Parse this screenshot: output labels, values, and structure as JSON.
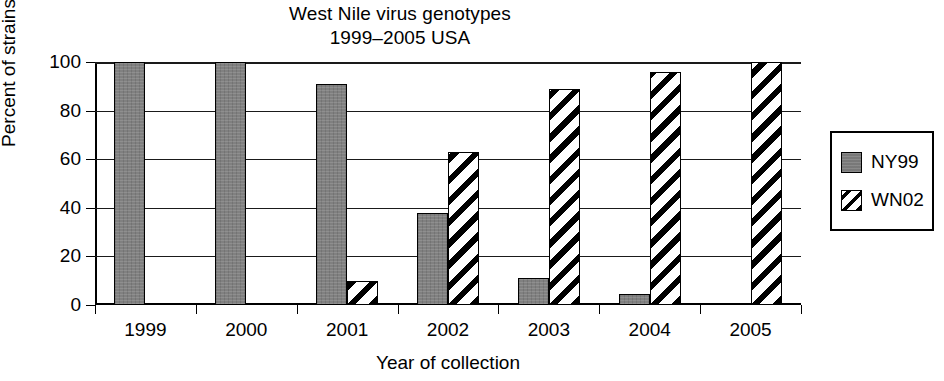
{
  "chart_data": {
    "type": "bar",
    "title": "West Nile virus genotypes",
    "subtitle": "1999–2005 USA",
    "xlabel": "Year of collection",
    "ylabel": "Percent of strains",
    "categories": [
      "1999",
      "2000",
      "2001",
      "2002",
      "2003",
      "2004",
      "2005"
    ],
    "series": [
      {
        "name": "NY99",
        "color": "#808080",
        "fill": "solid-gray",
        "values": [
          100,
          100,
          91,
          38,
          11,
          4.5,
          0
        ]
      },
      {
        "name": "WN02",
        "color": "#000000",
        "fill": "diagonal-hatch",
        "values": [
          0,
          0,
          10,
          63,
          89,
          96,
          100
        ]
      }
    ],
    "ylim": [
      0,
      100
    ],
    "yticks": [
      0,
      20,
      40,
      60,
      80,
      100
    ],
    "ytick_labels": [
      "0",
      "20",
      "40",
      "60",
      "80",
      "100"
    ],
    "grid": true,
    "grid_axis": "y",
    "legend_position": "right-outside",
    "legend_entries": [
      "NY99",
      "WN02"
    ]
  }
}
